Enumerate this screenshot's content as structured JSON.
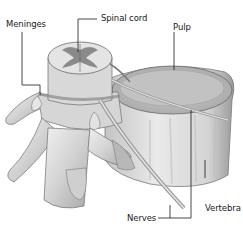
{
  "diagram": {
    "labels": {
      "meninges": "Meninges",
      "spinal_cord": "Spinal cord",
      "pulp": "Pulp",
      "vertebra": "Vertebra",
      "nerves": "Nerves"
    },
    "colors": {
      "background": "#ffffff",
      "bone_light": "#e6e6e6",
      "bone_mid": "#c8c8c8",
      "bone_dark": "#8a8a8a",
      "pulp": "#bdbdbd",
      "grey_matter": "#7a7a7a",
      "leader_line": "#1a1a1a"
    }
  }
}
